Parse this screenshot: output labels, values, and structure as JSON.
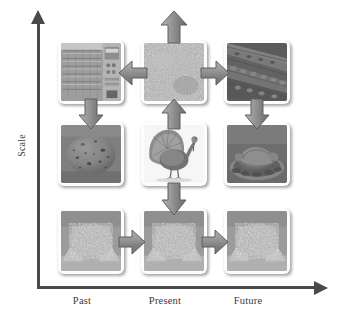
{
  "figure": {
    "type": "diagram",
    "axes": {
      "y_label": "Scale",
      "x_labels": [
        "Past",
        "Present",
        "Future"
      ],
      "y_arrow_direction": "up",
      "x_arrow_direction": "right"
    },
    "colors": {
      "axis": "#4a4a4a",
      "arrow_fill": "#8d8d8d",
      "arrow_stroke": "#5f5f5f",
      "card_background": "#fdfdfd",
      "text": "#3b3b3b",
      "page_background": "#ffffff"
    },
    "cells": [
      {
        "id": "cell-r0-c0",
        "row": 0,
        "col": 0,
        "scale_level": "large",
        "time": "Past",
        "image_name": "hatchery-incubator-photo",
        "caption": "Industrial incubator / hatchery cabinet with stacked egg trays and control panel"
      },
      {
        "id": "cell-r0-c1",
        "row": 0,
        "col": 1,
        "scale_level": "large",
        "time": "Present",
        "image_name": "grain-feed-pile-photo",
        "caption": "Close-up of loose grain feed mass"
      },
      {
        "id": "cell-r0-c2",
        "row": 0,
        "col": 2,
        "scale_level": "large",
        "time": "Future",
        "image_name": "poultry-house-interior-photo",
        "caption": "Poultry house interior with long rows of caged birds"
      },
      {
        "id": "cell-r1-c0",
        "row": 1,
        "col": 0,
        "scale_level": "medium",
        "time": "Past",
        "image_name": "speckled-egg-photo",
        "caption": "Single speckled turkey egg"
      },
      {
        "id": "cell-r1-c1",
        "row": 1,
        "col": 1,
        "scale_level": "medium",
        "time": "Present",
        "image_name": "live-turkey-photo",
        "caption": "Live tom turkey displaying fanned tail"
      },
      {
        "id": "cell-r1-c2",
        "row": 1,
        "col": 2,
        "scale_level": "medium",
        "time": "Future",
        "image_name": "roast-turkey-platter-photo",
        "caption": "Cooked roast turkey served on a garnished platter"
      },
      {
        "id": "cell-r2-c0",
        "row": 2,
        "col": 0,
        "scale_level": "small",
        "time": "Past",
        "image_name": "hands-holding-feed-photo-1",
        "caption": "Hands cupping a mound of grain feed"
      },
      {
        "id": "cell-r2-c1",
        "row": 2,
        "col": 1,
        "scale_level": "small",
        "time": "Present",
        "image_name": "hands-holding-feed-photo-2",
        "caption": "Hands cupping a mound of grain feed"
      },
      {
        "id": "cell-r2-c2",
        "row": 2,
        "col": 2,
        "scale_level": "small",
        "time": "Future",
        "image_name": "hands-holding-feed-photo-3",
        "caption": "Hands cupping a mound of grain feed"
      }
    ],
    "arrows": [
      {
        "id": "arrow-top-center-up",
        "direction": "up",
        "from": "cell-r0-c1",
        "to": "outside-top"
      },
      {
        "id": "arrow-top-center-to-left",
        "direction": "left",
        "from": "cell-r0-c1",
        "to": "cell-r0-c0"
      },
      {
        "id": "arrow-top-center-to-right",
        "direction": "right",
        "from": "cell-r0-c1",
        "to": "cell-r0-c2"
      },
      {
        "id": "arrow-left-col-down",
        "direction": "down",
        "from": "cell-r0-c0",
        "to": "cell-r1-c0"
      },
      {
        "id": "arrow-center-mid-up",
        "direction": "up",
        "from": "cell-r1-c1",
        "to": "cell-r0-c1"
      },
      {
        "id": "arrow-right-col-down",
        "direction": "down",
        "from": "cell-r0-c2",
        "to": "cell-r1-c2"
      },
      {
        "id": "arrow-center-mid-down",
        "direction": "down",
        "from": "cell-r1-c1",
        "to": "cell-r2-c1"
      },
      {
        "id": "arrow-bottom-left-right",
        "direction": "right",
        "from": "cell-r2-c0",
        "to": "cell-r2-c1"
      },
      {
        "id": "arrow-bottom-center-right",
        "direction": "right",
        "from": "cell-r2-c1",
        "to": "cell-r2-c2"
      }
    ]
  }
}
